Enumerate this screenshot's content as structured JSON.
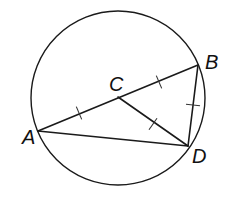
{
  "figure": {
    "type": "geometry",
    "colors": {
      "stroke": "#1a1a1a",
      "background": "#ffffff"
    },
    "circle": {
      "name": "circle-C",
      "cx": 118,
      "cy": 98,
      "r": 87
    },
    "points": [
      {
        "id": "A",
        "label": "A",
        "x": 38,
        "y": 131,
        "label_x": 22,
        "label_y": 144
      },
      {
        "id": "B",
        "label": "B",
        "x": 198,
        "y": 65,
        "label_x": 205,
        "label_y": 69
      },
      {
        "id": "C",
        "label": "C",
        "x": 118,
        "y": 97,
        "label_x": 109,
        "label_y": 91
      },
      {
        "id": "D",
        "label": "D",
        "x": 188,
        "y": 146,
        "label_x": 192,
        "label_y": 163
      }
    ],
    "segments": [
      {
        "from": "A",
        "to": "B"
      },
      {
        "from": "A",
        "to": "D"
      },
      {
        "from": "B",
        "to": "D"
      },
      {
        "from": "C",
        "to": "D"
      }
    ],
    "congruence_ticks": [
      {
        "segment": "AC",
        "x": 79,
        "y": 113
      },
      {
        "segment": "CB",
        "x": 159,
        "y": 82
      },
      {
        "segment": "CD",
        "x": 153,
        "y": 124
      },
      {
        "segment": "BD",
        "x": 193,
        "y": 105
      }
    ]
  },
  "labels": {
    "A": "A",
    "B": "B",
    "C": "C",
    "D": "D"
  }
}
